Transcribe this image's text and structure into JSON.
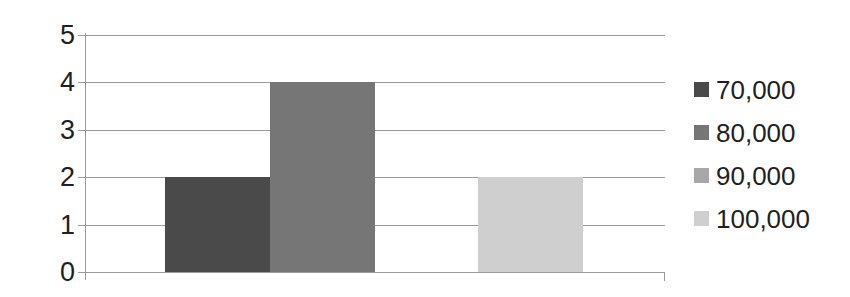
{
  "chart_data": {
    "type": "bar",
    "title": "",
    "subtitle": "",
    "xlabel": "",
    "ylabel": "",
    "categories": [
      "70,000",
      "80,000",
      "90,000",
      "100,000"
    ],
    "values": [
      2,
      4,
      0,
      2
    ],
    "series": [
      {
        "name": "Frequency",
        "values": [
          2,
          4,
          0,
          2
        ]
      }
    ],
    "ylim": [
      0,
      5
    ],
    "yticks": [
      "0",
      "1",
      "2",
      "3",
      "4",
      "5"
    ],
    "xticks": [],
    "grid": "horizontal",
    "legend_position": "right",
    "bar_colors": [
      "#4a4a4a",
      "#767676",
      "#a8a8a8",
      "#cfcfcf"
    ],
    "annotations": []
  },
  "axes": {
    "y": {
      "ticks": [
        {
          "label": "5",
          "value": 5
        },
        {
          "label": "4",
          "value": 4
        },
        {
          "label": "3",
          "value": 3
        },
        {
          "label": "2",
          "value": 2
        },
        {
          "label": "1",
          "value": 1
        },
        {
          "label": "0",
          "value": 0
        }
      ]
    }
  },
  "legend": {
    "items": [
      {
        "label": "70,000",
        "color": "#4a4a4a"
      },
      {
        "label": "80,000",
        "color": "#767676"
      },
      {
        "label": "90,000",
        "color": "#a8a8a8"
      },
      {
        "label": "100,000",
        "color": "#cfcfcf"
      }
    ]
  },
  "colors": {
    "gridline": "#9b9b9b",
    "axis": "#9b9b9b",
    "text": "#231f20",
    "background": "#ffffff"
  }
}
